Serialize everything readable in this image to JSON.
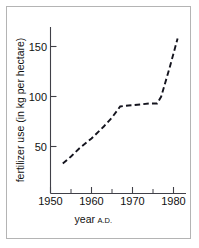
{
  "chart_data": {
    "type": "line",
    "title": "",
    "xlabel": "year A.D.",
    "xlabel_main": "year",
    "xlabel_suffix": "A.D.",
    "ylabel": "fertilizer use (in kg per hectare)",
    "xlim": [
      1950,
      1982
    ],
    "ylim": [
      0,
      170
    ],
    "x_ticks": [
      1950,
      1960,
      1970,
      1980
    ],
    "x_tick_labels": [
      "1950",
      "1960",
      "1970",
      "1980"
    ],
    "x_minor_ticks": [
      1955,
      1965,
      1975
    ],
    "y_ticks": [
      50,
      100,
      150
    ],
    "y_tick_labels": [
      "50",
      "100",
      "150"
    ],
    "grid": false,
    "legend": "none",
    "line_style": "dashed",
    "line_color": "#14141e",
    "series": [
      {
        "name": "fertilizer use",
        "x": [
          1953,
          1955,
          1957,
          1960,
          1963,
          1965,
          1967,
          1969,
          1972,
          1974,
          1976,
          1977,
          1979,
          1981
        ],
        "values": [
          33,
          40,
          48,
          58,
          70,
          79,
          90,
          91,
          92,
          93,
          93,
          100,
          128,
          158
        ]
      }
    ]
  },
  "axis": {
    "y_label": "fertilizer use (in kg per hectare)",
    "x_label_main": "year",
    "x_label_suffix": "A.D."
  },
  "colors": {
    "frame": "#b4b4b4",
    "axis": "#404048",
    "line": "#14141e",
    "background": "#ffffff"
  }
}
